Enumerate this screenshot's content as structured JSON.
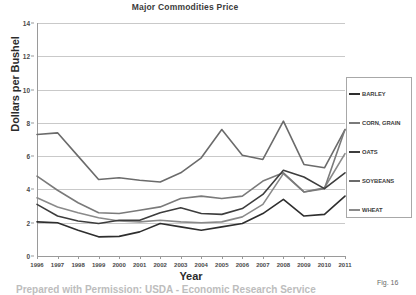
{
  "figure": {
    "number_label": "Fig. 16",
    "footer_caption": "Prepared with Permission: USDA - Economic Research Service"
  },
  "chart_data": {
    "type": "line",
    "title": "Major Commodities Price",
    "xlabel": "Year",
    "ylabel": "Dollars per Bushel",
    "xlim": [
      1996,
      2011
    ],
    "ylim": [
      0,
      14
    ],
    "ytick_step": 2,
    "yticks": [
      "0",
      "2",
      "4",
      "6",
      "8",
      "10",
      "12",
      "14"
    ],
    "grid": true,
    "legend_position": "right",
    "categories": [
      "1996",
      "1997",
      "1998",
      "1999",
      "2000",
      "2001",
      "2002",
      "2003",
      "2004",
      "2005",
      "2006",
      "2007",
      "2008",
      "2009",
      "2010",
      "2011"
    ],
    "series": [
      {
        "name": "BARLEY",
        "color": "#2e2e2e",
        "values": [
          2.05,
          2.0,
          1.55,
          1.15,
          1.18,
          1.45,
          1.95,
          1.75,
          1.55,
          1.75,
          1.95,
          2.55,
          3.4,
          2.4,
          2.5,
          3.6
        ]
      },
      {
        "name": "CORN, GRAIN",
        "color": "#7a7a7a",
        "values": [
          4.8,
          3.95,
          3.2,
          2.6,
          2.55,
          2.75,
          2.95,
          3.45,
          3.6,
          3.45,
          3.6,
          4.5,
          5.0,
          3.85,
          4.05,
          7.6
        ]
      },
      {
        "name": "OATS",
        "color": "#3d3d3d",
        "values": [
          3.1,
          2.4,
          2.1,
          1.95,
          2.15,
          2.15,
          2.6,
          2.9,
          2.55,
          2.5,
          2.85,
          3.7,
          5.15,
          4.75,
          4.05,
          5.0
        ]
      },
      {
        "name": "SOYBEANS",
        "color": "#6b6b6b",
        "values": [
          7.3,
          7.4,
          6.0,
          4.6,
          4.7,
          4.55,
          4.45,
          5.0,
          5.9,
          7.6,
          6.05,
          5.8,
          8.1,
          9.7,
          10.6,
          12.65
        ]
      },
      {
        "name": "WHEAT",
        "color": "#8a8a8a",
        "values": [
          3.5,
          2.95,
          2.6,
          2.3,
          2.1,
          2.05,
          2.15,
          2.05,
          2.0,
          2.05,
          2.35,
          4.4,
          11.4,
          10.2,
          10.1,
          6.15
        ]
      }
    ],
    "series_pixel_paths": {
      "SOYBEANS": [
        7.3,
        7.4,
        6.0,
        4.6,
        4.7,
        4.55,
        4.45,
        5.0,
        5.9,
        7.6,
        6.05,
        5.8,
        8.1,
        5.5,
        5.3,
        7.6
      ],
      "WHEAT": [
        3.5,
        2.95,
        2.6,
        2.3,
        2.1,
        2.05,
        2.15,
        2.05,
        2.0,
        2.05,
        2.35,
        3.1,
        4.95,
        3.85,
        4.1,
        6.15
      ]
    }
  }
}
